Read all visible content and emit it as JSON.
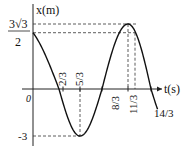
{
  "chart_data": {
    "type": "line",
    "title": "",
    "function": "x = 3cos(pi*t/2 + pi/6)",
    "xlabel": "t(s)",
    "ylabel": "x(m)",
    "origin_label": "0",
    "amplitude": 3,
    "initial_value": 2.598,
    "initial_value_label": {
      "numerator": "3√3",
      "denominator": "2"
    },
    "y_tick_labels": [
      "-3"
    ],
    "x_tick_labels": [
      "2/3",
      "5/3",
      "8/3",
      "11/3",
      "14/3"
    ],
    "key_points": [
      {
        "t": 0,
        "x": 2.598
      },
      {
        "t": 0.6667,
        "x": 0
      },
      {
        "t": 1.6667,
        "x": -3
      },
      {
        "t": 2.6667,
        "x": 0
      },
      {
        "t": 3.6667,
        "x": 3
      },
      {
        "t": 4.6667,
        "x": 0
      }
    ],
    "grid": false,
    "legend": "none",
    "colors": {
      "curve": "#111111",
      "axis": "#222222",
      "dashed": "#333333"
    }
  }
}
